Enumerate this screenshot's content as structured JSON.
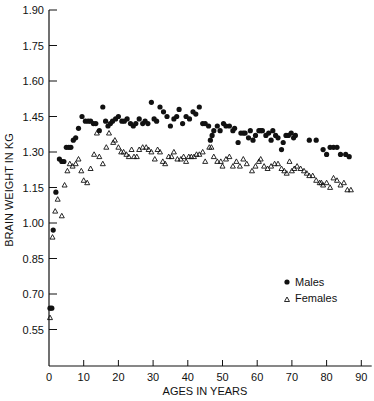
{
  "chart_data": {
    "type": "scatter",
    "title": "",
    "xlabel": "AGES IN YEARS",
    "ylabel": "BRAIN WEIGHT IN KG",
    "xlim": [
      0,
      92
    ],
    "ylim": [
      0.43,
      1.9
    ],
    "x_ticks": [
      0,
      10,
      20,
      30,
      40,
      50,
      60,
      70,
      80,
      90
    ],
    "y_ticks": [
      "1.90",
      "1.75",
      "1.60",
      "1.45",
      "1.30",
      "1.15",
      "1.00",
      "0.85",
      "0.70",
      "0.55"
    ],
    "grid": false,
    "legend_position": "lower right inside",
    "series": [
      {
        "name": "Males",
        "marker": "filled-circle",
        "color": "#111111",
        "points": [
          [
            0.3,
            0.64
          ],
          [
            0.8,
            0.64
          ],
          [
            1.2,
            0.97
          ],
          [
            2,
            1.13
          ],
          [
            3,
            1.27
          ],
          [
            3.7,
            1.26
          ],
          [
            4.3,
            1.26
          ],
          [
            5,
            1.32
          ],
          [
            5.7,
            1.32
          ],
          [
            6.3,
            1.32
          ],
          [
            7,
            1.35
          ],
          [
            7.7,
            1.36
          ],
          [
            8.5,
            1.4
          ],
          [
            9.5,
            1.45
          ],
          [
            10.5,
            1.43
          ],
          [
            11.3,
            1.43
          ],
          [
            12,
            1.43
          ],
          [
            12.8,
            1.42
          ],
          [
            13.5,
            1.42
          ],
          [
            14.5,
            1.39
          ],
          [
            15.5,
            1.49
          ],
          [
            16.3,
            1.43
          ],
          [
            17,
            1.41
          ],
          [
            17.7,
            1.42
          ],
          [
            18.3,
            1.43
          ],
          [
            19.2,
            1.44
          ],
          [
            20,
            1.45
          ],
          [
            21,
            1.43
          ],
          [
            21.7,
            1.43
          ],
          [
            22.5,
            1.44
          ],
          [
            23.5,
            1.42
          ],
          [
            24.3,
            1.41
          ],
          [
            25,
            1.42
          ],
          [
            26,
            1.44
          ],
          [
            27,
            1.42
          ],
          [
            27.7,
            1.43
          ],
          [
            28.5,
            1.42
          ],
          [
            29.5,
            1.51
          ],
          [
            30.3,
            1.44
          ],
          [
            31,
            1.43
          ],
          [
            32,
            1.49
          ],
          [
            33,
            1.47
          ],
          [
            34,
            1.45
          ],
          [
            35,
            1.41
          ],
          [
            36,
            1.44
          ],
          [
            36.8,
            1.45
          ],
          [
            37.5,
            1.48
          ],
          [
            38.5,
            1.42
          ],
          [
            39.5,
            1.45
          ],
          [
            40.5,
            1.44
          ],
          [
            41.5,
            1.47
          ],
          [
            42.3,
            1.46
          ],
          [
            43.3,
            1.49
          ],
          [
            44.3,
            1.42
          ],
          [
            45,
            1.42
          ],
          [
            46,
            1.41
          ],
          [
            46.5,
            1.35
          ],
          [
            47,
            1.37
          ],
          [
            47.5,
            1.39
          ],
          [
            48.5,
            1.41
          ],
          [
            49.3,
            1.39
          ],
          [
            50.3,
            1.42
          ],
          [
            51,
            1.41
          ],
          [
            52,
            1.41
          ],
          [
            53,
            1.39
          ],
          [
            53.5,
            1.4
          ],
          [
            54.5,
            1.34
          ],
          [
            55.3,
            1.38
          ],
          [
            56,
            1.38
          ],
          [
            56.5,
            1.38
          ],
          [
            57.5,
            1.36
          ],
          [
            58,
            1.39
          ],
          [
            58.8,
            1.35
          ],
          [
            59.5,
            1.37
          ],
          [
            60.5,
            1.39
          ],
          [
            61,
            1.39
          ],
          [
            61.5,
            1.39
          ],
          [
            62.5,
            1.37
          ],
          [
            63.3,
            1.38
          ],
          [
            64,
            1.35
          ],
          [
            64.5,
            1.39
          ],
          [
            65.3,
            1.37
          ],
          [
            66,
            1.36
          ],
          [
            67,
            1.31
          ],
          [
            67.5,
            1.34
          ],
          [
            68.3,
            1.37
          ],
          [
            69,
            1.37
          ],
          [
            69.8,
            1.38
          ],
          [
            70.5,
            1.36
          ],
          [
            71,
            1.37
          ],
          [
            75,
            1.35
          ],
          [
            77,
            1.35
          ],
          [
            79,
            1.31
          ],
          [
            80,
            1.29
          ],
          [
            81,
            1.32
          ],
          [
            82,
            1.32
          ],
          [
            83,
            1.32
          ],
          [
            84,
            1.29
          ],
          [
            85.5,
            1.29
          ],
          [
            86.5,
            1.28
          ]
        ]
      },
      {
        "name": "Females",
        "marker": "open-triangle",
        "color": "#111111",
        "points": [
          [
            0.3,
            0.6
          ],
          [
            1,
            0.94
          ],
          [
            1.8,
            1.05
          ],
          [
            2.5,
            1.1
          ],
          [
            3.7,
            1.03
          ],
          [
            4.5,
            1.16
          ],
          [
            5.3,
            1.22
          ],
          [
            6,
            1.25
          ],
          [
            6.8,
            1.24
          ],
          [
            7.7,
            1.25
          ],
          [
            8.5,
            1.27
          ],
          [
            9.3,
            1.22
          ],
          [
            10,
            1.18
          ],
          [
            11,
            1.17
          ],
          [
            12,
            1.23
          ],
          [
            13,
            1.29
          ],
          [
            13.8,
            1.38
          ],
          [
            14.5,
            1.28
          ],
          [
            15.5,
            1.25
          ],
          [
            16.5,
            1.32
          ],
          [
            17.3,
            1.38
          ],
          [
            18.5,
            1.34
          ],
          [
            19,
            1.35
          ],
          [
            20,
            1.32
          ],
          [
            20.8,
            1.3
          ],
          [
            21.5,
            1.3
          ],
          [
            22.3,
            1.29
          ],
          [
            23,
            1.28
          ],
          [
            23.8,
            1.31
          ],
          [
            24.5,
            1.28
          ],
          [
            25.3,
            1.28
          ],
          [
            26,
            1.31
          ],
          [
            27,
            1.32
          ],
          [
            28,
            1.32
          ],
          [
            28.7,
            1.31
          ],
          [
            29.5,
            1.3
          ],
          [
            30.5,
            1.27
          ],
          [
            31.3,
            1.31
          ],
          [
            32,
            1.3
          ],
          [
            32.8,
            1.26
          ],
          [
            33.5,
            1.25
          ],
          [
            34.5,
            1.28
          ],
          [
            35.3,
            1.28
          ],
          [
            36,
            1.3
          ],
          [
            37,
            1.27
          ],
          [
            38,
            1.27
          ],
          [
            38.8,
            1.28
          ],
          [
            39.5,
            1.26
          ],
          [
            40.3,
            1.28
          ],
          [
            41,
            1.28
          ],
          [
            41.8,
            1.28
          ],
          [
            42.5,
            1.29
          ],
          [
            43.3,
            1.29
          ],
          [
            44.3,
            1.3
          ],
          [
            45,
            1.26
          ],
          [
            46.2,
            1.32
          ],
          [
            46.8,
            1.32
          ],
          [
            47.5,
            1.28
          ],
          [
            48.5,
            1.26
          ],
          [
            49.5,
            1.26
          ],
          [
            50,
            1.24
          ],
          [
            51,
            1.27
          ],
          [
            52,
            1.28
          ],
          [
            53,
            1.24
          ],
          [
            54,
            1.26
          ],
          [
            55,
            1.24
          ],
          [
            56,
            1.27
          ],
          [
            57,
            1.25
          ],
          [
            58.5,
            1.22
          ],
          [
            59.5,
            1.24
          ],
          [
            60.5,
            1.26
          ],
          [
            61,
            1.27
          ],
          [
            62,
            1.24
          ],
          [
            63,
            1.23
          ],
          [
            64,
            1.24
          ],
          [
            65,
            1.25
          ],
          [
            66,
            1.25
          ],
          [
            67,
            1.23
          ],
          [
            67.8,
            1.22
          ],
          [
            68.5,
            1.21
          ],
          [
            69.3,
            1.26
          ],
          [
            70,
            1.22
          ],
          [
            70.7,
            1.23
          ],
          [
            71.5,
            1.24
          ],
          [
            72.5,
            1.23
          ],
          [
            73.5,
            1.22
          ],
          [
            74.3,
            1.21
          ],
          [
            75,
            1.2
          ],
          [
            76,
            1.2
          ],
          [
            77,
            1.18
          ],
          [
            78,
            1.17
          ],
          [
            78.5,
            1.17
          ],
          [
            79,
            1.16
          ],
          [
            80,
            1.17
          ],
          [
            81,
            1.15
          ],
          [
            82,
            1.19
          ],
          [
            83,
            1.18
          ],
          [
            84,
            1.16
          ],
          [
            85,
            1.17
          ],
          [
            86,
            1.14
          ],
          [
            87,
            1.14
          ]
        ]
      }
    ]
  },
  "legend": {
    "items": [
      {
        "label": "Males",
        "marker": "filled-circle"
      },
      {
        "label": "Females",
        "marker": "open-triangle"
      }
    ]
  },
  "axes": {
    "xlabel": "AGES IN YEARS",
    "ylabel": "BRAIN WEIGHT IN KG"
  }
}
